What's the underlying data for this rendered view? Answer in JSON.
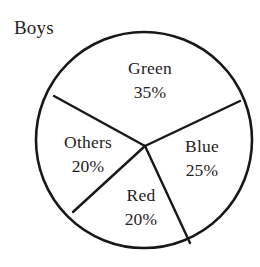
{
  "chart_data": {
    "type": "pie",
    "title": "Boys",
    "xlabel": "",
    "ylabel": "",
    "legend": "none",
    "grid": false,
    "value_suffix": "%",
    "total": 100,
    "categories": [
      "Green",
      "Blue",
      "Red",
      "Others"
    ],
    "values": [
      35,
      25,
      20,
      20
    ],
    "slices": [
      {
        "label": "Green",
        "value": 35,
        "value_text": "35%",
        "label_x": 150,
        "label_y": 74,
        "value_x": 150,
        "value_y": 98
      },
      {
        "label": "Blue",
        "value": 25,
        "value_text": "25%",
        "label_x": 202,
        "label_y": 152,
        "value_x": 202,
        "value_y": 176
      },
      {
        "label": "Red",
        "value": 20,
        "value_text": "20%",
        "label_x": 141,
        "label_y": 201,
        "value_x": 141,
        "value_y": 225
      },
      {
        "label": "Others",
        "value": 20,
        "value_text": "20%",
        "label_x": 88,
        "label_y": 148,
        "value_x": 88,
        "value_y": 172
      }
    ],
    "geometry": {
      "center_x": 144,
      "center_y": 140,
      "radius": 108,
      "vertex_x": 145,
      "vertex_y": 146,
      "dividers": [
        {
          "name": "green-others-divider",
          "x2": 54,
          "y2": 96
        },
        {
          "name": "green-blue-divider",
          "x2": 240,
          "y2": 101
        },
        {
          "name": "blue-red-divider",
          "x2": 190,
          "y2": 243
        },
        {
          "name": "red-others-divider",
          "x2": 73,
          "y2": 212
        }
      ]
    },
    "colors": {
      "stroke": "#1a1718",
      "text": "#262223",
      "background": "#ffffff",
      "slice_fill": "#ffffff"
    }
  }
}
